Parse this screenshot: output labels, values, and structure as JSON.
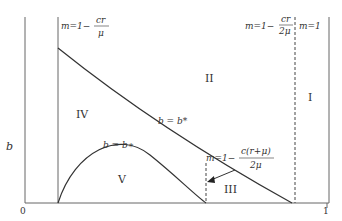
{
  "diagram": {
    "y_axis_label": "b",
    "x_axis_start": "0",
    "x_axis_end": "1",
    "regions": [
      "I",
      "II",
      "III",
      "IV",
      "V"
    ],
    "boundaries": {
      "left": "m = 1 − cr/μ",
      "middle": "m = 1 − c(r+μ)/2μ",
      "right_dashed": "m = 1 − cr/2μ",
      "right": "m = 1"
    },
    "curves": {
      "upper": "b = b*",
      "lower": "b = b∗"
    },
    "labels": {
      "m_eq_1_minus": "m=1−",
      "cr": "cr",
      "mu": "μ",
      "two_mu": "2μ",
      "c_r_mu": "c(r+μ)",
      "m_eq_1": "m=1",
      "b_star_upper": "b = b*",
      "b_star_lower": "b = b∗"
    },
    "colors": {
      "line": "#333333",
      "axis": "#555555"
    }
  }
}
